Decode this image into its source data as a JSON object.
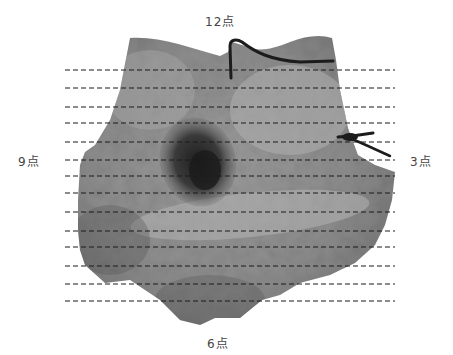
{
  "figure": {
    "type": "gross-pathology-specimen-photo",
    "orientation_labels": {
      "top": "12点",
      "left": "9点",
      "right": "3点",
      "bottom": "6点"
    },
    "sectioning_lines": {
      "count": 14,
      "style": "dashed",
      "color": "#1a1a1a",
      "x_start": 65,
      "x_end": 395,
      "y_positions": [
        70,
        88,
        107,
        123,
        142,
        160,
        176,
        193,
        212,
        231,
        247,
        266,
        284,
        301
      ]
    },
    "colors": {
      "background": "#ffffff",
      "tissue_base": "#8a8a8a",
      "tissue_light": "#b4b4b4",
      "lesion_dark": "#2a2a2a",
      "suture": "#1c1c1c",
      "label_text": "#444444"
    },
    "markers": {
      "top_suture": "suture-12-oclock",
      "right_suture": "suture-3-oclock"
    }
  }
}
